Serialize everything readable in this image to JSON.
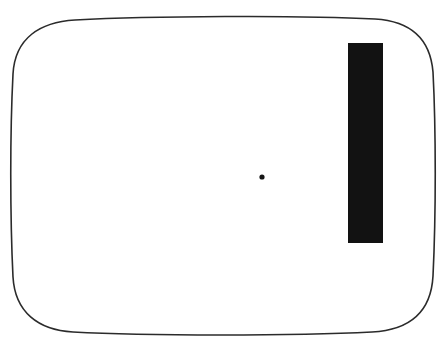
{
  "figure": {
    "type": "line-drawing",
    "title": "",
    "background_color": "#ffffff",
    "width": 448,
    "height": 349,
    "frame": {
      "name": "rounded-rectangle-frame",
      "shape": "rounded-rectangle",
      "style": "hand-drawn outline, slightly bowed edges",
      "stroke_color": "#2b2b2b",
      "fill_color": "#ffffff",
      "stroke_width": 1.6,
      "left": 13,
      "top": 16,
      "right": 434,
      "bottom": 334,
      "corner_radius": 58
    },
    "bar": {
      "name": "vertical-black-bar",
      "shape": "rectangle",
      "fill_color": "#121212",
      "x": 348,
      "y": 43,
      "width": 35,
      "height": 200
    },
    "dot": {
      "name": "center-fixation-dot",
      "shape": "circle",
      "fill_color": "#161616",
      "cx": 262,
      "cy": 177,
      "radius": 2.6
    }
  }
}
